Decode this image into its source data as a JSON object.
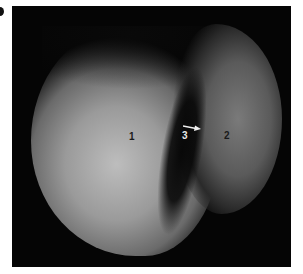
{
  "figure": {
    "panel_label": "a",
    "image_kind": "grayscale endoscopic photograph",
    "annotations": [
      {
        "id": "label-1",
        "text": "1",
        "color": "#1a1a1a"
      },
      {
        "id": "label-2",
        "text": "2",
        "color": "#1a1a1a"
      },
      {
        "id": "label-3",
        "text": "3",
        "color": "#e8e8e8"
      }
    ],
    "arrow": {
      "color": "#f0f0f0",
      "direction": "right",
      "points_to": "label-2"
    }
  }
}
